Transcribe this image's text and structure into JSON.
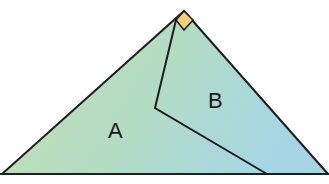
{
  "diagram": {
    "regions": [
      {
        "id": "A",
        "label": "A"
      },
      {
        "id": "B",
        "label": "B"
      }
    ],
    "right_angle_marker": true,
    "colors": {
      "fill_left": "#bfe0b0",
      "fill_right": "#a9d8e2",
      "stroke": "#1e1e1e",
      "marker_fill": "#f3cf7a"
    }
  }
}
